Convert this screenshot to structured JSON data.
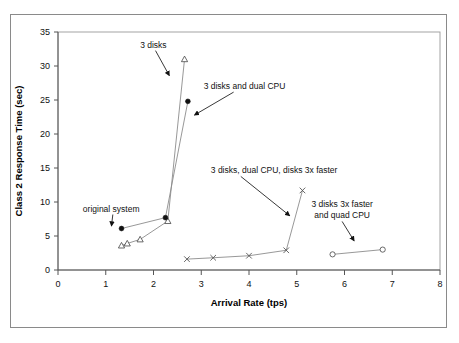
{
  "chart_data": {
    "type": "scatter",
    "title": "",
    "xlabel": "Arrival Rate (tps)",
    "ylabel": "Class 2 Response Time (sec)",
    "xlim": [
      0,
      8
    ],
    "ylim": [
      0,
      35
    ],
    "xticks": [
      0,
      1,
      2,
      3,
      4,
      5,
      6,
      7,
      8
    ],
    "yticks": [
      0,
      5,
      10,
      15,
      20,
      25,
      30,
      35
    ],
    "grid": false,
    "legend": "none (series labeled by annotations)",
    "series": [
      {
        "name": "3 disks",
        "marker": "open-triangle",
        "x": [
          1.33,
          1.45,
          1.72,
          2.3,
          2.65
        ],
        "y": [
          3.6,
          3.9,
          4.5,
          7.2,
          31.0
        ]
      },
      {
        "name": "3 disks and dual CPU",
        "marker": "filled-circle",
        "x": [
          1.33,
          2.25,
          2.72
        ],
        "y": [
          6.1,
          7.7,
          24.8
        ]
      },
      {
        "name": "3 disks, dual CPU, disks 3x faster",
        "marker": "x",
        "x": [
          2.7,
          3.25,
          4.0,
          4.78,
          5.12
        ],
        "y": [
          1.6,
          1.8,
          2.1,
          2.9,
          11.7
        ]
      },
      {
        "name": "3 disks 3x faster and quad CPU",
        "marker": "open-circle",
        "x": [
          5.75,
          6.8
        ],
        "y": [
          2.3,
          3.0
        ]
      }
    ],
    "annotations": [
      {
        "label": "3 disks",
        "text_x": 1.72,
        "text_y": 32.7,
        "arrow_to_x": 2.33,
        "arrow_to_y": 28.6
      },
      {
        "label": "3 disks and dual CPU",
        "text_x": 3.05,
        "text_y": 26.6,
        "arrow_to_x": 2.86,
        "arrow_to_y": 22.8
      },
      {
        "label": "3 disks, dual CPU, disks 3x faster",
        "text_x": 3.2,
        "text_y": 14.2,
        "arrow_to_x": 4.85,
        "arrow_to_y": 8.0
      },
      {
        "label": "3 disks 3x faster and quad CPU",
        "text_x": 5.95,
        "text_y": 9.2,
        "arrow_to_x": 6.2,
        "arrow_to_y": 4.3
      },
      {
        "label": "original system",
        "text_x": 0.52,
        "text_y": 8.6,
        "arrow_to_x": 1.12,
        "arrow_to_y": 6.5
      }
    ],
    "annotation_lines": {
      "3 disks, dual CPU, disks 3x faster": [
        "3 disks, dual CPU, disks 3x faster"
      ],
      "3 disks 3x faster and quad CPU": [
        "3 disks 3x faster",
        "and quad CPU"
      ]
    }
  },
  "axes": {
    "x_title": "Arrival Rate (tps)",
    "y_title": "Class 2 Response Time (sec)",
    "x_tick_labels": [
      "0",
      "1",
      "2",
      "3",
      "4",
      "5",
      "6",
      "7",
      "8"
    ],
    "y_tick_labels": [
      "0",
      "5",
      "10",
      "15",
      "20",
      "25",
      "30",
      "35"
    ]
  },
  "annotations_text": {
    "three_disks": "3 disks",
    "three_disks_dual_cpu": "3 disks and dual CPU",
    "three_disks_dual_cpu_3x": "3 disks, dual CPU, disks 3x faster",
    "three_disks_3x_quad_line1": "3 disks 3x faster",
    "three_disks_3x_quad_line2": "and quad CPU",
    "original_system": "original system"
  },
  "colors": {
    "background": "#ffffff",
    "frame": "#8a8a8a",
    "axis": "#555555",
    "series_line": "#8c8c8c",
    "marker_fill": "#111111",
    "marker_open": "#ffffff",
    "text": "#111111"
  }
}
